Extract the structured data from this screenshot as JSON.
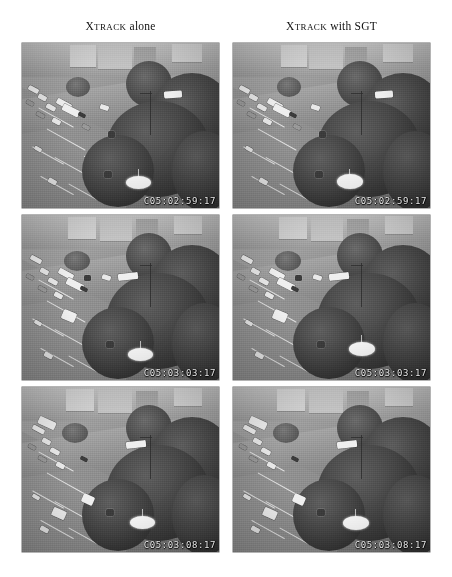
{
  "figure": {
    "columns": [
      {
        "id": "left",
        "title_cap": "X",
        "title_smallcaps": "TRACK",
        "title_rest": " alone",
        "full_label": "XTRACK alone"
      },
      {
        "id": "right",
        "title_cap": "X",
        "title_smallcaps": "TRACK",
        "title_rest": " with SGT",
        "full_label": "XTRACK with SGT"
      }
    ],
    "rows": [
      {
        "index": 1,
        "timecode": "C05:02:59:17"
      },
      {
        "index": 2,
        "timecode": "C05:03:03:17"
      },
      {
        "index": 3,
        "timecode": "C05:03:08:17"
      }
    ],
    "panels": [
      {
        "row": 1,
        "column": "left",
        "timecode": "C05:02:59:17",
        "scene": "aerial-intersection",
        "marker": "white-ellipse-track"
      },
      {
        "row": 1,
        "column": "right",
        "timecode": "C05:02:59:17",
        "scene": "aerial-intersection",
        "marker": "white-ellipse-track"
      },
      {
        "row": 2,
        "column": "left",
        "timecode": "C05:03:03:17",
        "scene": "aerial-intersection",
        "marker": "white-ellipse-track"
      },
      {
        "row": 2,
        "column": "right",
        "timecode": "C05:03:03:17",
        "scene": "aerial-intersection",
        "marker": "white-ellipse-track"
      },
      {
        "row": 3,
        "column": "left",
        "timecode": "C05:03:08:17",
        "scene": "aerial-intersection",
        "marker": "white-ellipse-track"
      },
      {
        "row": 3,
        "column": "right",
        "timecode": "C05:03:08:17",
        "scene": "aerial-intersection",
        "marker": "white-ellipse-track"
      }
    ],
    "colors": {
      "page_background": "#ffffff",
      "panel_base": "#8d8d8d",
      "canopy_dark": "#343434",
      "road": "#949494",
      "lane_marking": "#efefef",
      "timecode_text": "#f2f2f2",
      "marker": "#f7f7f7",
      "header_text": "#101010"
    }
  }
}
